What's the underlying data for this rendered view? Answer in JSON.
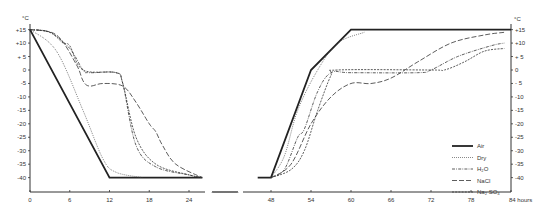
{
  "chart_data": {
    "type": "line",
    "title": "",
    "xlabel": "hours",
    "ylabel": "°C",
    "y_unit_left": "°C",
    "y_unit_right": "°C",
    "ylim": [
      -45,
      17
    ],
    "xlim": [
      0,
      84
    ],
    "x_axis_break": [
      26,
      46
    ],
    "x_ticks": [
      0,
      6,
      12,
      18,
      24,
      48,
      54,
      60,
      66,
      72,
      78,
      84
    ],
    "x_tick_labels": [
      "0",
      "6",
      "12",
      "18",
      "24",
      "48",
      "54",
      "60",
      "66",
      "72",
      "78",
      "84 hours"
    ],
    "y_ticks": [
      15,
      10,
      5,
      0,
      -5,
      -10,
      -15,
      -20,
      -25,
      -30,
      -35,
      -40
    ],
    "y_tick_labels_left": [
      "+15",
      "+10",
      "+ 5",
      "0",
      "-5",
      "-10",
      "-15",
      "-20",
      "-25",
      "-30",
      "-35",
      "-40"
    ],
    "y_tick_labels_right": [
      "+15",
      "+10",
      "+ 5",
      "0",
      "- 5",
      "-10",
      "-15",
      "-20",
      "-25",
      "-30",
      "-35",
      "-40"
    ],
    "grid": false,
    "legend_position": "lower right",
    "series": [
      {
        "name": "Air",
        "style": "solid-thick",
        "cooling": [
          [
            0,
            15
          ],
          [
            12,
            -40
          ],
          [
            26,
            -40
          ]
        ],
        "warming": [
          [
            46,
            -40
          ],
          [
            48,
            -40
          ],
          [
            54,
            0
          ],
          [
            60,
            15
          ],
          [
            84,
            15
          ]
        ]
      },
      {
        "name": "Dry",
        "style": "dotted",
        "cooling": [
          [
            0,
            15
          ],
          [
            4,
            7
          ],
          [
            8,
            -15
          ],
          [
            11,
            -33
          ],
          [
            13,
            -38
          ],
          [
            17,
            -40
          ]
        ],
        "warming": [
          [
            48,
            -40
          ],
          [
            50,
            -32
          ],
          [
            52,
            -15
          ],
          [
            55,
            0
          ],
          [
            58,
            10
          ],
          [
            62,
            14
          ]
        ]
      },
      {
        "name": "H2O",
        "style": "dash-dot",
        "cooling": [
          [
            0,
            15
          ],
          [
            3,
            14
          ],
          [
            6,
            8
          ],
          [
            8,
            0
          ],
          [
            9,
            -1
          ],
          [
            13,
            -1
          ],
          [
            14,
            -5
          ],
          [
            16,
            -28
          ],
          [
            19,
            -36
          ],
          [
            24,
            -39
          ],
          [
            26,
            -40
          ]
        ],
        "warming": [
          [
            48,
            -40
          ],
          [
            50,
            -37
          ],
          [
            52,
            -25
          ],
          [
            53,
            -22
          ],
          [
            55,
            -8
          ],
          [
            57,
            -1
          ],
          [
            60,
            -1
          ],
          [
            70,
            -1
          ],
          [
            72,
            0
          ],
          [
            76,
            5
          ],
          [
            81,
            9
          ],
          [
            83,
            10
          ]
        ]
      },
      {
        "name": "NaCl",
        "style": "long-dash",
        "cooling": [
          [
            0,
            15
          ],
          [
            4,
            13
          ],
          [
            7,
            2
          ],
          [
            8,
            -4
          ],
          [
            9,
            -6
          ],
          [
            11,
            -5
          ],
          [
            14,
            -6
          ],
          [
            16,
            -12
          ],
          [
            18,
            -20
          ],
          [
            19,
            -23
          ],
          [
            20,
            -28
          ],
          [
            22,
            -35
          ],
          [
            26,
            -40
          ]
        ],
        "warming": [
          [
            48,
            -40
          ],
          [
            51,
            -35
          ],
          [
            54,
            -20
          ],
          [
            57,
            -10
          ],
          [
            60,
            -5
          ],
          [
            63,
            -5
          ],
          [
            66,
            -3
          ],
          [
            70,
            3
          ],
          [
            75,
            10
          ],
          [
            80,
            13
          ],
          [
            83,
            14
          ]
        ]
      },
      {
        "name": "Na2SO4",
        "style": "short-dash",
        "cooling": [
          [
            0,
            15
          ],
          [
            3,
            14
          ],
          [
            5,
            10
          ],
          [
            6,
            9
          ],
          [
            8,
            0
          ],
          [
            13,
            -1
          ],
          [
            14,
            -5
          ],
          [
            16,
            -25
          ],
          [
            19,
            -35
          ],
          [
            24,
            -39
          ],
          [
            26,
            -40
          ]
        ],
        "warming": [
          [
            48,
            -40
          ],
          [
            51,
            -37
          ],
          [
            53,
            -30
          ],
          [
            55,
            -15
          ],
          [
            57,
            -2
          ],
          [
            58,
            0
          ],
          [
            72,
            0
          ],
          [
            74,
            0
          ],
          [
            77,
            3
          ],
          [
            80,
            7
          ],
          [
            83,
            8
          ]
        ]
      }
    ]
  },
  "legend": {
    "items": [
      {
        "label": "Air"
      },
      {
        "label": "Dry"
      },
      {
        "label": "H₂O"
      },
      {
        "label": "NaCl"
      },
      {
        "label": "Na₂ SO₄"
      }
    ]
  },
  "axes": {
    "left_unit": "°C",
    "right_unit": "°C",
    "x_unit": "hours",
    "break_symbol": "/////////"
  }
}
